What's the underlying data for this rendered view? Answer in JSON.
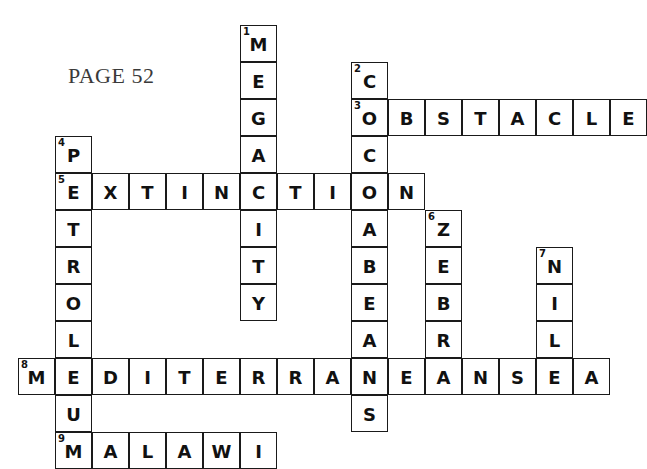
{
  "page": {
    "label": "PAGE 52",
    "label_x": 68,
    "label_y": 63,
    "background": "#ffffff",
    "ink_color": "#1a1a1a",
    "letter_color": "#111111"
  },
  "grid": {
    "cell_size": 37,
    "origin_x": 18,
    "origin_y": 25,
    "columns": 17,
    "rows": 12
  },
  "entries": [
    {
      "number": "1",
      "answer": "MEGACITY",
      "direction": "down",
      "col": 6,
      "row": 0,
      "length": 8
    },
    {
      "number": "2",
      "answer": "COCOABEANS",
      "direction": "down",
      "col": 9,
      "row": 1,
      "length": 10
    },
    {
      "number": "3",
      "answer": "OBSTACLE",
      "direction": "across",
      "col": 9,
      "row": 2,
      "length": 8
    },
    {
      "number": "4",
      "answer": "PETROLEUM",
      "direction": "down",
      "col": 1,
      "row": 3,
      "length": 9
    },
    {
      "number": "5",
      "answer": "EXTINCTION",
      "direction": "across",
      "col": 1,
      "row": 4,
      "length": 10
    },
    {
      "number": "6",
      "answer": "ZEBRA",
      "direction": "down",
      "col": 11,
      "row": 5,
      "length": 5
    },
    {
      "number": "7",
      "answer": "NILE",
      "direction": "down",
      "col": 14,
      "row": 6,
      "length": 4
    },
    {
      "number": "8",
      "answer": "MEDITERRANEANSEA",
      "direction": "across",
      "col": 0,
      "row": 9,
      "length": 16
    },
    {
      "number": "9",
      "answer": "MALAWI",
      "direction": "across",
      "col": 1,
      "row": 11,
      "length": 6
    }
  ],
  "cells": [
    {
      "name": "cell-r0c6",
      "letter": "M",
      "clue": "1",
      "col": 6,
      "row": 0
    },
    {
      "name": "cell-r1c6",
      "letter": "E",
      "clue": "",
      "col": 6,
      "row": 1
    },
    {
      "name": "cell-r2c6",
      "letter": "G",
      "clue": "",
      "col": 6,
      "row": 2
    },
    {
      "name": "cell-r3c6",
      "letter": "A",
      "clue": "",
      "col": 6,
      "row": 3
    },
    {
      "name": "cell-r4c6",
      "letter": "C",
      "clue": "",
      "col": 6,
      "row": 4
    },
    {
      "name": "cell-r5c6",
      "letter": "I",
      "clue": "",
      "col": 6,
      "row": 5
    },
    {
      "name": "cell-r6c6",
      "letter": "T",
      "clue": "",
      "col": 6,
      "row": 6
    },
    {
      "name": "cell-r7c6",
      "letter": "Y",
      "clue": "",
      "col": 6,
      "row": 7
    },
    {
      "name": "cell-r1c9",
      "letter": "C",
      "clue": "2",
      "col": 9,
      "row": 1
    },
    {
      "name": "cell-r2c9",
      "letter": "O",
      "clue": "3",
      "col": 9,
      "row": 2
    },
    {
      "name": "cell-r3c9",
      "letter": "C",
      "clue": "",
      "col": 9,
      "row": 3
    },
    {
      "name": "cell-r4c9",
      "letter": "O",
      "clue": "",
      "col": 9,
      "row": 4
    },
    {
      "name": "cell-r5c9",
      "letter": "A",
      "clue": "",
      "col": 9,
      "row": 5
    },
    {
      "name": "cell-r6c9",
      "letter": "B",
      "clue": "",
      "col": 9,
      "row": 6
    },
    {
      "name": "cell-r7c9",
      "letter": "E",
      "clue": "",
      "col": 9,
      "row": 7
    },
    {
      "name": "cell-r8c9",
      "letter": "A",
      "clue": "",
      "col": 9,
      "row": 8
    },
    {
      "name": "cell-r9c9",
      "letter": "N",
      "clue": "",
      "col": 9,
      "row": 9
    },
    {
      "name": "cell-r10c9",
      "letter": "S",
      "clue": "",
      "col": 9,
      "row": 10
    },
    {
      "name": "cell-r2c10",
      "letter": "B",
      "clue": "",
      "col": 10,
      "row": 2
    },
    {
      "name": "cell-r2c11",
      "letter": "S",
      "clue": "",
      "col": 11,
      "row": 2
    },
    {
      "name": "cell-r2c12",
      "letter": "T",
      "clue": "",
      "col": 12,
      "row": 2
    },
    {
      "name": "cell-r2c13",
      "letter": "A",
      "clue": "",
      "col": 13,
      "row": 2
    },
    {
      "name": "cell-r2c14",
      "letter": "C",
      "clue": "",
      "col": 14,
      "row": 2
    },
    {
      "name": "cell-r2c15",
      "letter": "L",
      "clue": "",
      "col": 15,
      "row": 2
    },
    {
      "name": "cell-r2c16",
      "letter": "E",
      "clue": "",
      "col": 16,
      "row": 2
    },
    {
      "name": "cell-r3c1",
      "letter": "P",
      "clue": "4",
      "col": 1,
      "row": 3
    },
    {
      "name": "cell-r4c1",
      "letter": "E",
      "clue": "5",
      "col": 1,
      "row": 4
    },
    {
      "name": "cell-r5c1",
      "letter": "T",
      "clue": "",
      "col": 1,
      "row": 5
    },
    {
      "name": "cell-r6c1",
      "letter": "R",
      "clue": "",
      "col": 1,
      "row": 6
    },
    {
      "name": "cell-r7c1",
      "letter": "O",
      "clue": "",
      "col": 1,
      "row": 7
    },
    {
      "name": "cell-r8c1",
      "letter": "L",
      "clue": "",
      "col": 1,
      "row": 8
    },
    {
      "name": "cell-r9c1",
      "letter": "E",
      "clue": "",
      "col": 1,
      "row": 9
    },
    {
      "name": "cell-r10c1",
      "letter": "U",
      "clue": "",
      "col": 1,
      "row": 10
    },
    {
      "name": "cell-r11c1",
      "letter": "M",
      "clue": "9",
      "col": 1,
      "row": 11
    },
    {
      "name": "cell-r4c2",
      "letter": "X",
      "clue": "",
      "col": 2,
      "row": 4
    },
    {
      "name": "cell-r4c3",
      "letter": "T",
      "clue": "",
      "col": 3,
      "row": 4
    },
    {
      "name": "cell-r4c4",
      "letter": "I",
      "clue": "",
      "col": 4,
      "row": 4
    },
    {
      "name": "cell-r4c5",
      "letter": "N",
      "clue": "",
      "col": 5,
      "row": 4
    },
    {
      "name": "cell-r4c7",
      "letter": "T",
      "clue": "",
      "col": 7,
      "row": 4
    },
    {
      "name": "cell-r4c8",
      "letter": "I",
      "clue": "",
      "col": 8,
      "row": 4
    },
    {
      "name": "cell-r4c10",
      "letter": "N",
      "clue": "",
      "col": 10,
      "row": 4
    },
    {
      "name": "cell-r5c11",
      "letter": "Z",
      "clue": "6",
      "col": 11,
      "row": 5
    },
    {
      "name": "cell-r6c11",
      "letter": "E",
      "clue": "",
      "col": 11,
      "row": 6
    },
    {
      "name": "cell-r7c11",
      "letter": "B",
      "clue": "",
      "col": 11,
      "row": 7
    },
    {
      "name": "cell-r8c11",
      "letter": "R",
      "clue": "",
      "col": 11,
      "row": 8
    },
    {
      "name": "cell-r6c14",
      "letter": "N",
      "clue": "7",
      "col": 14,
      "row": 6
    },
    {
      "name": "cell-r7c14",
      "letter": "I",
      "clue": "",
      "col": 14,
      "row": 7
    },
    {
      "name": "cell-r8c14",
      "letter": "L",
      "clue": "",
      "col": 14,
      "row": 8
    },
    {
      "name": "cell-r9c0",
      "letter": "M",
      "clue": "8",
      "col": 0,
      "row": 9
    },
    {
      "name": "cell-r9c2",
      "letter": "D",
      "clue": "",
      "col": 2,
      "row": 9
    },
    {
      "name": "cell-r9c3",
      "letter": "I",
      "clue": "",
      "col": 3,
      "row": 9
    },
    {
      "name": "cell-r9c4",
      "letter": "T",
      "clue": "",
      "col": 4,
      "row": 9
    },
    {
      "name": "cell-r9c5",
      "letter": "E",
      "clue": "",
      "col": 5,
      "row": 9
    },
    {
      "name": "cell-r9c6",
      "letter": "R",
      "clue": "",
      "col": 6,
      "row": 9
    },
    {
      "name": "cell-r9c7",
      "letter": "R",
      "clue": "",
      "col": 7,
      "row": 9
    },
    {
      "name": "cell-r9c8",
      "letter": "A",
      "clue": "",
      "col": 8,
      "row": 9
    },
    {
      "name": "cell-r9c10",
      "letter": "E",
      "clue": "",
      "col": 10,
      "row": 9
    },
    {
      "name": "cell-r9c11",
      "letter": "A",
      "clue": "",
      "col": 11,
      "row": 9
    },
    {
      "name": "cell-r9c12",
      "letter": "N",
      "clue": "",
      "col": 12,
      "row": 9
    },
    {
      "name": "cell-r9c13",
      "letter": "S",
      "clue": "",
      "col": 13,
      "row": 9
    },
    {
      "name": "cell-r9c14",
      "letter": "E",
      "clue": "",
      "col": 14,
      "row": 9
    },
    {
      "name": "cell-r9c15",
      "letter": "A",
      "clue": "",
      "col": 15,
      "row": 9
    },
    {
      "name": "cell-r11c2",
      "letter": "A",
      "clue": "",
      "col": 2,
      "row": 11
    },
    {
      "name": "cell-r11c3",
      "letter": "L",
      "clue": "",
      "col": 3,
      "row": 11
    },
    {
      "name": "cell-r11c4",
      "letter": "A",
      "clue": "",
      "col": 4,
      "row": 11
    },
    {
      "name": "cell-r11c5",
      "letter": "W",
      "clue": "",
      "col": 5,
      "row": 11
    },
    {
      "name": "cell-r11c6",
      "letter": "I",
      "clue": "",
      "col": 6,
      "row": 11
    }
  ]
}
